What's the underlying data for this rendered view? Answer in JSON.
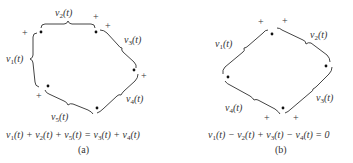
{
  "figures": [
    {
      "id": "a",
      "caption": "(a)",
      "equation": "v1(t) + v2(t) + v5(t) = v3(t) + v4(t)",
      "equation_parts": [
        {
          "v": "v",
          "s": "1",
          "t": "(t) + "
        },
        {
          "v": "v",
          "s": "2",
          "t": "(t) + "
        },
        {
          "v": "v",
          "s": "5",
          "t": "(t) = "
        },
        {
          "v": "v",
          "s": "3",
          "t": "(t) + "
        },
        {
          "v": "v",
          "s": "4",
          "t": "(t)"
        }
      ],
      "nodes": 5,
      "branches": [
        {
          "label": "v",
          "sub": "1",
          "arg": "(t)",
          "polarity": "+"
        },
        {
          "label": "v",
          "sub": "2",
          "arg": "(t)",
          "polarity": "+"
        },
        {
          "label": "v",
          "sub": "3",
          "arg": "(t)",
          "polarity": "+"
        },
        {
          "label": "v",
          "sub": "4",
          "arg": "(t)",
          "polarity": "+"
        },
        {
          "label": "v",
          "sub": "5",
          "arg": "(t)",
          "polarity": "+"
        }
      ]
    },
    {
      "id": "b",
      "caption": "(b)",
      "equation": "v1(t) − v2(t) + v3(t) − v4(t) = 0",
      "equation_parts": [
        {
          "v": "v",
          "s": "1",
          "t": "(t) − "
        },
        {
          "v": "v",
          "s": "2",
          "t": "(t) + "
        },
        {
          "v": "v",
          "s": "3",
          "t": "(t) − "
        },
        {
          "v": "v",
          "s": "4",
          "t": "(t) = 0"
        }
      ],
      "nodes": 4,
      "branches": [
        {
          "label": "v",
          "sub": "1",
          "arg": "(t)",
          "polarity": "+"
        },
        {
          "label": "v",
          "sub": "2",
          "arg": "(t)",
          "polarity": "+"
        },
        {
          "label": "v",
          "sub": "3",
          "arg": "(t)",
          "polarity": "+"
        },
        {
          "label": "v",
          "sub": "4",
          "arg": "(t)",
          "polarity": "+"
        }
      ]
    }
  ],
  "symbols": {
    "plus": "+"
  }
}
